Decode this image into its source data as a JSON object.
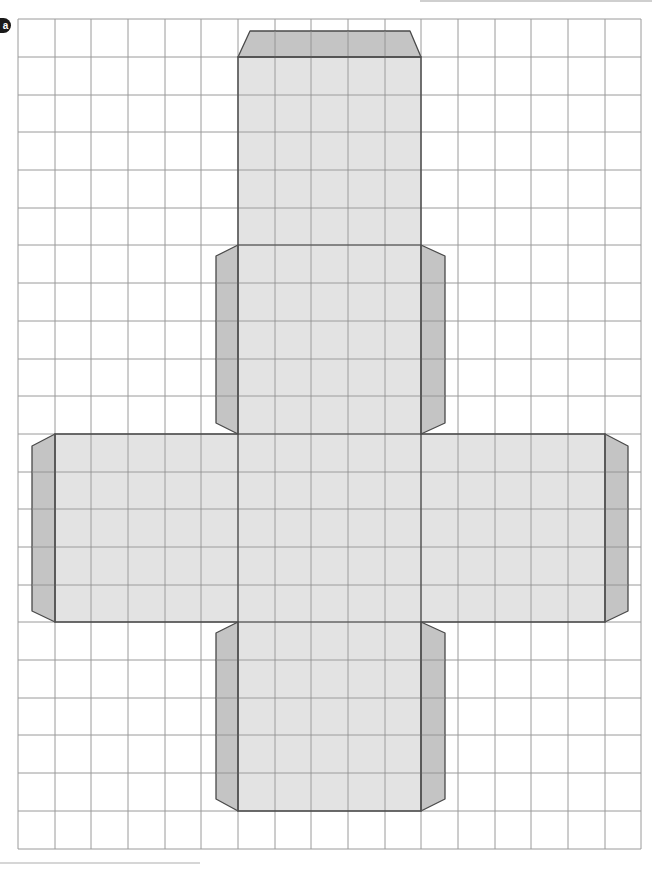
{
  "worksheet": {
    "part_label": "a",
    "figure": "cube-net-with-glue-tabs"
  },
  "grid": {
    "columns": 17,
    "rows": 22,
    "x_lines": [
      18,
      55,
      91,
      128,
      165,
      201,
      238,
      275,
      311,
      348,
      385,
      421,
      458,
      495,
      531,
      568,
      605,
      641
    ],
    "y_lines": [
      19,
      57,
      95,
      132,
      170,
      208,
      245,
      283,
      321,
      359,
      396,
      434,
      472,
      509,
      547,
      585,
      622,
      660,
      698,
      735,
      773,
      811,
      849
    ],
    "line_color": "#9a9a9a"
  },
  "colors": {
    "face_fill": "#e3e3e3",
    "tab_fill": "#c4c4c4",
    "outline": "#4a4a4a"
  },
  "net": {
    "faces": [
      {
        "name": "top-face",
        "x": 238,
        "y": 57,
        "w": 183,
        "h": 188
      },
      {
        "name": "upper-middle-face",
        "x": 238,
        "y": 245,
        "w": 183,
        "h": 189
      },
      {
        "name": "left-face",
        "x": 55,
        "y": 434,
        "w": 183,
        "h": 188
      },
      {
        "name": "center-face",
        "x": 238,
        "y": 434,
        "w": 183,
        "h": 188
      },
      {
        "name": "right-face",
        "x": 421,
        "y": 434,
        "w": 184,
        "h": 188
      },
      {
        "name": "bottom-face",
        "x": 238,
        "y": 622,
        "w": 183,
        "h": 189
      }
    ],
    "tabs": [
      {
        "name": "top-tab",
        "points": "238,57 250,31 410,31 421,57"
      },
      {
        "name": "upper-left-tab",
        "points": "238,245 216,256 216,423 238,434"
      },
      {
        "name": "upper-right-tab",
        "points": "421,245 445,256 445,423 421,434"
      },
      {
        "name": "far-left-tab",
        "points": "55,434 32,446 32,611 55,622"
      },
      {
        "name": "far-right-tab",
        "points": "605,434 628,446 628,611 605,622"
      },
      {
        "name": "lower-left-tab",
        "points": "238,622 216,633 216,799 238,811"
      },
      {
        "name": "lower-right-tab",
        "points": "421,622 445,633 445,799 421,811"
      }
    ]
  }
}
